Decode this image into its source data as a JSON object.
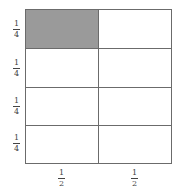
{
  "diagram": {
    "title": "",
    "rows": 4,
    "cols": 2,
    "shaded_cells": [
      [
        0,
        0
      ]
    ],
    "shade_color": "#9a9a9a",
    "row_labels": [
      {
        "num": "1",
        "den": "4"
      },
      {
        "num": "1",
        "den": "4"
      },
      {
        "num": "1",
        "den": "4"
      },
      {
        "num": "1",
        "den": "4"
      }
    ],
    "col_labels": [
      {
        "num": "1",
        "den": "2"
      },
      {
        "num": "1",
        "den": "2"
      }
    ]
  }
}
